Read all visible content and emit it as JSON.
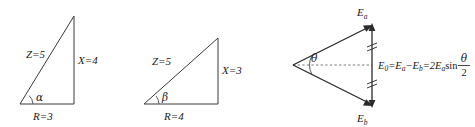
{
  "figure": {
    "background_color": "#ffffff",
    "line_color": "#3a3a3a",
    "text_color": "#1a1a1a",
    "width": 475,
    "height": 126
  },
  "panels": [
    {
      "id": "impedance-triangle-alpha",
      "type": "right-triangle",
      "hypotenuse_label": "Z=5",
      "vertical_label": "X=4",
      "base_label": "R=3",
      "angle_symbol": "α",
      "vertices": {
        "apex": [
          74,
          16
        ],
        "corner": [
          74,
          104
        ],
        "origin": [
          20,
          104
        ]
      }
    },
    {
      "id": "impedance-triangle-beta",
      "type": "right-triangle",
      "hypotenuse_label": "Z=5",
      "vertical_label": "X=3",
      "base_label": "R=4",
      "angle_symbol": "β",
      "vertices": {
        "apex": [
          218,
          38
        ],
        "corner": [
          218,
          104
        ],
        "origin": [
          144,
          104
        ]
      }
    },
    {
      "id": "phasor-difference-diagram",
      "type": "vector-diagram",
      "apex": [
        293,
        65
      ],
      "vector_a_tip": [
        372,
        25
      ],
      "vector_b_tip": [
        372,
        106
      ],
      "angle_symbol": "θ",
      "vector_a_label": "E",
      "vector_a_sub": "a",
      "vector_b_label": "E",
      "vector_b_sub": "b",
      "resultant_label": "E",
      "resultant_sub": "0",
      "tick_marks": 2,
      "formula": {
        "lhs": "E",
        "lhs_sub": "0",
        "eq1": "=",
        "term1": "E",
        "term1_sub": "a",
        "minus": "−",
        "term2": "E",
        "term2_sub": "b",
        "eq2": "=",
        "coeff": "2E",
        "coeff_sub": "a",
        "func": "sin",
        "frac_numerator": "θ",
        "frac_denominator": "2",
        "plain_text": "E₀=Eₐ−Eₕ=2Eₐsin θ/2"
      }
    }
  ]
}
